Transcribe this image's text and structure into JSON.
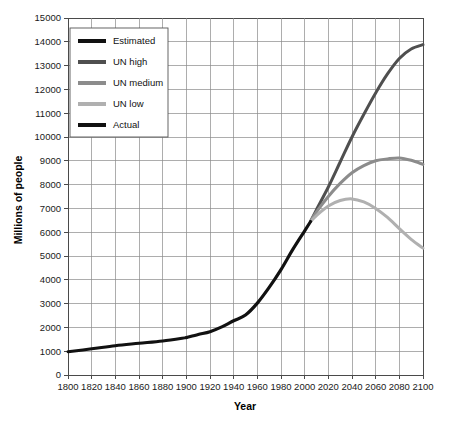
{
  "chart_data": {
    "type": "line",
    "title": "",
    "xlabel": "Year",
    "ylabel": "Millions of people",
    "xlim": [
      1800,
      2100
    ],
    "ylim": [
      0,
      15000
    ],
    "xticks": [
      1800,
      1820,
      1840,
      1860,
      1880,
      1900,
      1920,
      1940,
      1960,
      1980,
      2000,
      2020,
      2040,
      2060,
      2080,
      2100
    ],
    "yticks": [
      0,
      1000,
      2000,
      3000,
      4000,
      5000,
      6000,
      7000,
      8000,
      9000,
      10000,
      11000,
      12000,
      13000,
      14000,
      15000
    ],
    "grid": true,
    "legend_position": "top-left",
    "series": [
      {
        "name": "Estimated",
        "color": "#111111",
        "width": 3.0,
        "x": [
          1800,
          1820,
          1840,
          1860,
          1880,
          1900
        ],
        "values": [
          980,
          1100,
          1230,
          1330,
          1430,
          1570
        ]
      },
      {
        "name": "UN high",
        "color": "#4f4f4f",
        "width": 3.0,
        "x": [
          2005,
          2010,
          2020,
          2030,
          2040,
          2050,
          2060,
          2070,
          2080,
          2090,
          2100
        ],
        "values": [
          6450,
          6950,
          7900,
          8950,
          10000,
          10950,
          11850,
          12650,
          13300,
          13700,
          13880
        ]
      },
      {
        "name": "UN medium",
        "color": "#8c8c8c",
        "width": 3.0,
        "x": [
          2005,
          2010,
          2020,
          2030,
          2040,
          2050,
          2060,
          2070,
          2080,
          2090,
          2100
        ],
        "values": [
          6450,
          6850,
          7500,
          8050,
          8500,
          8800,
          9000,
          9080,
          9120,
          9020,
          8850
        ]
      },
      {
        "name": "UN low",
        "color": "#b0b0b0",
        "width": 3.0,
        "x": [
          2005,
          2010,
          2020,
          2030,
          2040,
          2050,
          2060,
          2070,
          2080,
          2090,
          2100
        ],
        "values": [
          6450,
          6700,
          7100,
          7330,
          7400,
          7270,
          7000,
          6620,
          6150,
          5700,
          5330
        ]
      },
      {
        "name": "Actual",
        "color": "#111111",
        "width": 3.2,
        "x": [
          1900,
          1910,
          1920,
          1930,
          1940,
          1950,
          1960,
          1970,
          1980,
          1990,
          2000,
          2005
        ],
        "values": [
          1570,
          1700,
          1820,
          2020,
          2280,
          2520,
          3020,
          3680,
          4430,
          5280,
          6060,
          6450
        ]
      }
    ],
    "legend_entries": [
      {
        "label": "Estimated",
        "color": "#111111"
      },
      {
        "label": "UN high",
        "color": "#4f4f4f"
      },
      {
        "label": "UN medium",
        "color": "#8c8c8c"
      },
      {
        "label": "UN low",
        "color": "#b0b0b0"
      },
      {
        "label": "Actual",
        "color": "#111111"
      }
    ]
  },
  "axes": {
    "x_title": "Year",
    "y_title": "Millions of people"
  }
}
